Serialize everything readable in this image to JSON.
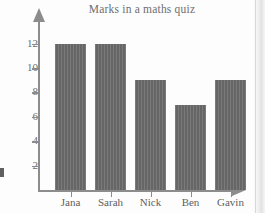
{
  "chart_data": {
    "type": "bar",
    "title": "Marks in a maths quiz",
    "xlabel": "",
    "ylabel": "",
    "categories": [
      "Jana",
      "Sarah",
      "Nick",
      "Ben",
      "Gavin"
    ],
    "values": [
      12,
      12,
      9,
      7,
      9
    ],
    "yticks": [
      2,
      4,
      6,
      8,
      10,
      12
    ],
    "ylim": [
      0,
      13
    ],
    "grid": false,
    "legend": null,
    "bar_color": "#6b6b6b",
    "axis_color": "#8c8c8c",
    "text_color": "#6d6d6d"
  },
  "axes": {
    "y_arrow": "up-arrow-icon",
    "x_arrow": "right-arrow-icon"
  }
}
